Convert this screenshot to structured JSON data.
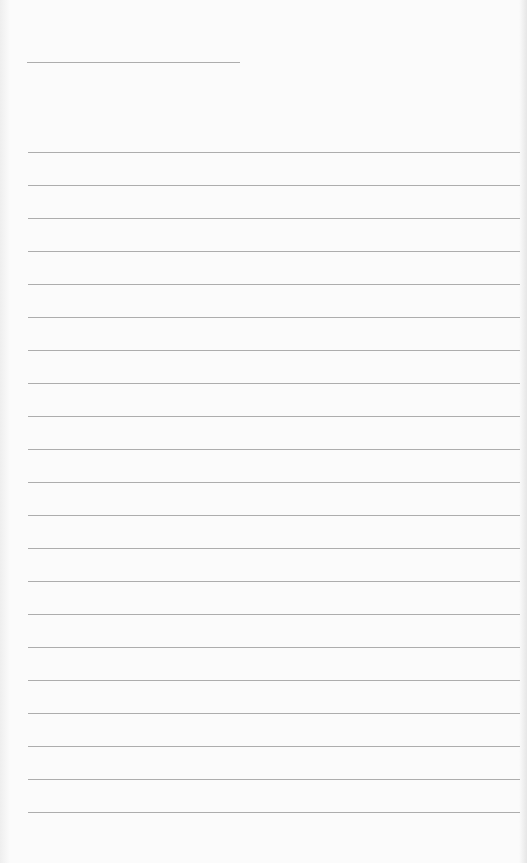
{
  "document": {
    "type": "lined-paper",
    "background_color": "#fbfbfb",
    "line_color": "#adadad",
    "header_rule": {
      "top": 62,
      "left": 27,
      "width": 213
    },
    "ruled_lines": {
      "count": 21,
      "first_top": 152,
      "spacing": 33,
      "left": 28,
      "width": 492
    },
    "text_content": ""
  }
}
